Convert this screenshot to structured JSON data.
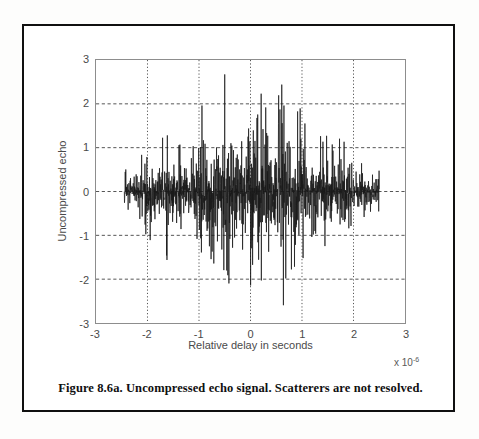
{
  "caption": "Figure 8.6a. Uncompressed echo signal. Scatterers are not resolved.",
  "axes": {
    "x_exponent_prefix": "x 10",
    "x_exponent_power": "-6"
  },
  "chart_data": {
    "type": "line",
    "title": "",
    "subtitle": "",
    "xlabel": "Relative delay in seconds",
    "ylabel": "Uncompressed echo",
    "x_tick_labels": [
      "-3",
      "-2",
      "-1",
      "0",
      "1",
      "2",
      "3"
    ],
    "x_ticks": [
      -3,
      -2,
      -1,
      0,
      1,
      2,
      3
    ],
    "y_tick_labels": [
      "3",
      "2",
      "1",
      "0",
      "-1",
      "-2",
      "-3"
    ],
    "y_ticks": [
      3,
      2,
      1,
      0,
      -1,
      -2,
      -3
    ],
    "xlim": [
      -3,
      3
    ],
    "ylim": [
      -3,
      3
    ],
    "x_scale_exponent": -6,
    "x_unit": "seconds",
    "grid": true,
    "grid_style": "dotted-vertical-dashed-horizontal",
    "grid_color": "#555555",
    "legend": "none",
    "line_color": "#1a1a1a",
    "background": "#ffffff",
    "series": [
      {
        "name": "Uncompressed echo",
        "description": "Dense random RF echo waveform (speckle) spanning roughly -2.45 to 2.5 microseconds; amplitude envelope rises from about 0.5 at the edges to a maximum near 2.85 close to zero delay.",
        "x_start": -2.45,
        "x_end": 2.5,
        "n_samples": 1400,
        "envelope_peak": 2.85,
        "envelope_min": 0.45,
        "max_value": 2.85,
        "min_value": -2.65,
        "envelope_profile": [
          {
            "x": -2.45,
            "amp": 0.5
          },
          {
            "x": -2.2,
            "amp": 0.62
          },
          {
            "x": -2.0,
            "amp": 1.3
          },
          {
            "x": -1.8,
            "amp": 0.95
          },
          {
            "x": -1.6,
            "amp": 1.7
          },
          {
            "x": -1.4,
            "amp": 1.05
          },
          {
            "x": -1.25,
            "amp": 1.85
          },
          {
            "x": -1.1,
            "amp": 1.15
          },
          {
            "x": -0.95,
            "amp": 2.45
          },
          {
            "x": -0.8,
            "amp": 1.6
          },
          {
            "x": -0.65,
            "amp": 1.95
          },
          {
            "x": -0.5,
            "amp": 2.55
          },
          {
            "x": -0.35,
            "amp": 1.75
          },
          {
            "x": -0.2,
            "amp": 2.1
          },
          {
            "x": -0.08,
            "amp": 2.85
          },
          {
            "x": 0.05,
            "amp": 2.3
          },
          {
            "x": 0.2,
            "amp": 2.25
          },
          {
            "x": 0.3,
            "amp": 2.65
          },
          {
            "x": 0.45,
            "amp": 1.8
          },
          {
            "x": 0.6,
            "amp": 2.55
          },
          {
            "x": 0.75,
            "amp": 2.35
          },
          {
            "x": 0.9,
            "amp": 1.9
          },
          {
            "x": 1.0,
            "amp": 2.1
          },
          {
            "x": 1.15,
            "amp": 1.35
          },
          {
            "x": 1.3,
            "amp": 1.2
          },
          {
            "x": 1.45,
            "amp": 1.7
          },
          {
            "x": 1.6,
            "amp": 1.0
          },
          {
            "x": 1.8,
            "amp": 1.25
          },
          {
            "x": 2.0,
            "amp": 0.85
          },
          {
            "x": 2.2,
            "amp": 0.7
          },
          {
            "x": 2.5,
            "amp": 0.45
          }
        ]
      }
    ]
  }
}
